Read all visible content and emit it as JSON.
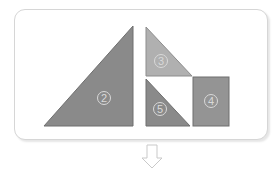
{
  "canvas": {
    "width": 280,
    "height": 173,
    "background": "#ffffff"
  },
  "panel": {
    "name": "shape-container",
    "border_color": "#d6d6d6",
    "fill": "#ffffff",
    "corner_radius": 11
  },
  "shapes": [
    {
      "id": "triangle-2",
      "kind": "right-triangle",
      "label": "2",
      "fill": "#8a8a8a",
      "stroke": "#6f6f6f",
      "points": "44,126 133,126 133,26",
      "label_x": 104,
      "label_y": 98
    },
    {
      "id": "triangle-3",
      "kind": "right-triangle",
      "label": "3",
      "fill": "#b0b0b0",
      "stroke": "#8d8d8d",
      "points": "146,27 146,76 192,76",
      "label_x": 161,
      "label_y": 61
    },
    {
      "id": "triangle-5",
      "kind": "right-triangle",
      "label": "5",
      "fill": "#8a8a8a",
      "stroke": "#6f6f6f",
      "points": "146,79 146,126 190,126",
      "label_x": 160,
      "label_y": 109
    },
    {
      "id": "square-4",
      "kind": "square",
      "label": "4",
      "fill": "#949494",
      "stroke": "#6f6f6f",
      "x": 193,
      "y": 77,
      "width": 36,
      "height": 49,
      "label_x": 211,
      "label_y": 101
    }
  ],
  "arrow": {
    "name": "down-arrow",
    "direction": "down",
    "fill": "#ffffff",
    "stroke": "#c9c9c9",
    "points": "147,145 157,145 157,158 162,158 152,168 142,158 147,158"
  }
}
